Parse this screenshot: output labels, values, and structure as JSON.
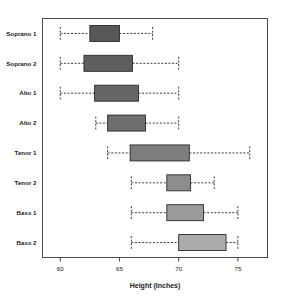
{
  "chart_data": {
    "type": "box",
    "title": "",
    "xlabel": "Height (Inches)",
    "ylabel": "",
    "orientation": "horizontal",
    "grid": false,
    "legend": "none",
    "xlim": [
      58.5,
      77.5
    ],
    "xticks": [
      60,
      65,
      70,
      75
    ],
    "xtick_labels": [
      "60",
      "65",
      "70",
      "75"
    ],
    "categories": [
      "Soprano 1",
      "Soprano 2",
      "Alto 1",
      "Alto 2",
      "Tenor 1",
      "Tenor 2",
      "Bass 1",
      "Bass 2"
    ],
    "boxes": [
      {
        "category": "Soprano 1",
        "min": 60.0,
        "q1": 62.5,
        "median": 63.8,
        "q3": 65.0,
        "max": 67.8,
        "color": "#575757"
      },
      {
        "category": "Soprano 2",
        "min": 60.0,
        "q1": 62.0,
        "median": 64.0,
        "q3": 66.1,
        "max": 70.0,
        "color": "#5e5e5e"
      },
      {
        "category": "Alto 1",
        "min": 60.0,
        "q1": 62.9,
        "median": 64.8,
        "q3": 66.6,
        "max": 70.0,
        "color": "#666666"
      },
      {
        "category": "Alto 2",
        "min": 63.0,
        "q1": 64.0,
        "median": 65.6,
        "q3": 67.2,
        "max": 70.0,
        "color": "#6e6e6e"
      },
      {
        "category": "Tenor 1",
        "min": 64.0,
        "q1": 65.9,
        "median": 68.4,
        "q3": 70.9,
        "max": 76.0,
        "color": "#7d7d7d"
      },
      {
        "category": "Tenor 2",
        "min": 66.0,
        "q1": 69.0,
        "median": 70.0,
        "q3": 71.0,
        "max": 73.0,
        "color": "#8d8d8d"
      },
      {
        "category": "Bass 1",
        "min": 66.0,
        "q1": 69.0,
        "median": 70.6,
        "q3": 72.1,
        "max": 75.0,
        "color": "#9a9a9a"
      },
      {
        "category": "Bass 2",
        "min": 66.0,
        "q1": 70.0,
        "median": 72.0,
        "q3": 74.0,
        "max": 75.0,
        "color": "#ababab"
      }
    ]
  },
  "axes": {
    "x_title": "Height (Inches)"
  }
}
